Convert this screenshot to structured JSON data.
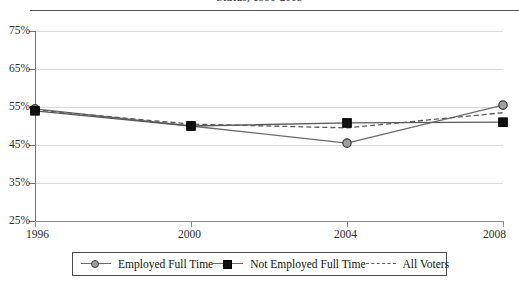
{
  "chart_data": {
    "type": "line",
    "title": "Status, 1996-2008",
    "xlabel": "",
    "ylabel": "",
    "x": [
      1996,
      2000,
      2004,
      2008
    ],
    "categories": [
      "1996",
      "2000",
      "2004",
      "2008"
    ],
    "ylim": [
      25,
      75
    ],
    "yticks": [
      25,
      35,
      45,
      55,
      65,
      75
    ],
    "ytick_labels": [
      "25%",
      "35%",
      "45%",
      "55%",
      "65%",
      "75%"
    ],
    "xtick_labels": [
      "1996",
      "2000",
      "2004",
      "2008"
    ],
    "grid": true,
    "legend_position": "bottom",
    "series": [
      {
        "name": "Employed Full Time",
        "marker": "circle",
        "linestyle": "solid",
        "color": "#6b6b6b",
        "marker_fill": "#9e9e9e",
        "values": [
          54.5,
          50.0,
          45.5,
          55.5
        ]
      },
      {
        "name": "Not Employed Full Time",
        "marker": "square",
        "linestyle": "solid",
        "color": "#5a5a5a",
        "marker_fill": "#101010",
        "values": [
          54.0,
          50.0,
          50.8,
          51.0
        ]
      },
      {
        "name": "All Voters",
        "marker": "none",
        "linestyle": "dashed",
        "color": "#5c5c5c",
        "marker_fill": "none",
        "values": [
          54.2,
          50.5,
          49.5,
          53.5
        ]
      }
    ]
  },
  "legend": {
    "items": [
      {
        "label": "Employed Full Time",
        "key": "circle-line-key"
      },
      {
        "label": "Not Employed Full Time",
        "key": "square-line-key"
      },
      {
        "label": "All Voters",
        "key": "dashed-line-key"
      }
    ]
  }
}
